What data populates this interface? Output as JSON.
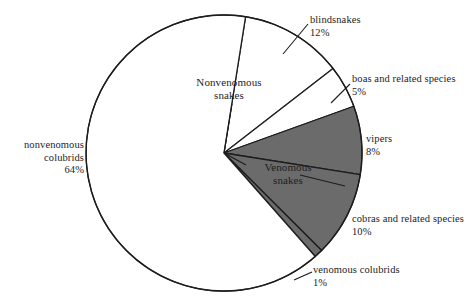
{
  "chart_data": {
    "type": "pie",
    "title": "",
    "subtitle": "",
    "xlabel": "",
    "ylabel": "",
    "legend_position": "none",
    "grid": false,
    "units": "percent",
    "total": 100,
    "groups": [
      {
        "key": "nonvenomous",
        "label": "Nonvenomous\nsnakes",
        "label_line1": "Nonvenomous",
        "label_line2": "snakes",
        "total_pct": 81
      },
      {
        "key": "venomous",
        "label": "Venomous\nsnakes",
        "label_line1": "Venomous",
        "label_line2": "snakes",
        "total_pct": 19
      }
    ],
    "categories": [
      "blindsnakes",
      "boas and related species",
      "vipers",
      "cobras and related species",
      "venomous colubrids",
      "nonvenomous colubrids"
    ],
    "values": [
      12,
      5,
      8,
      10,
      1,
      64
    ],
    "slices": [
      {
        "name": "blindsnakes",
        "label": "blindsnakes",
        "value": 12,
        "percent_text": "12%",
        "group": "nonvenomous",
        "fill": "#ffffff",
        "stroke": "#1d1d1d"
      },
      {
        "name": "boas and related species",
        "label": "boas and related species",
        "value": 5,
        "percent_text": "5%",
        "group": "nonvenomous",
        "fill": "#ffffff",
        "stroke": "#1d1d1d"
      },
      {
        "name": "vipers",
        "label": "vipers",
        "value": 8,
        "percent_text": "8%",
        "group": "venomous",
        "fill": "#6b6b6b",
        "stroke": "#1d1d1d"
      },
      {
        "name": "cobras and related species",
        "label": "cobras and related species",
        "value": 10,
        "percent_text": "10%",
        "group": "venomous",
        "fill": "#6b6b6b",
        "stroke": "#1d1d1d"
      },
      {
        "name": "venomous colubrids",
        "label": "venomous colubrids",
        "value": 1,
        "percent_text": "1%",
        "group": "venomous",
        "fill": "#6b6b6b",
        "stroke": "#1d1d1d"
      },
      {
        "name": "nonvenomous colubrids",
        "label": "nonvenomous colubrids",
        "label_line1": "nonvenomous",
        "label_line2": "colubrids",
        "value": 64,
        "percent_text": "64%",
        "group": "nonvenomous",
        "fill": "#ffffff",
        "stroke": "#1d1d1d"
      }
    ],
    "colors": {
      "venomous_fill": "#6b6b6b",
      "nonvenomous_fill": "#ffffff",
      "outline": "#1d1d1d",
      "text": "#1d1d1d",
      "background": "#ffffff"
    }
  }
}
